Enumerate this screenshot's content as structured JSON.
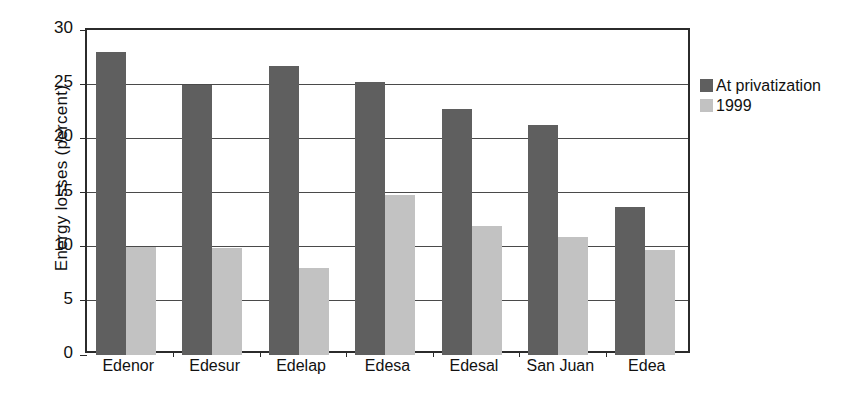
{
  "chart_data": {
    "type": "bar",
    "title": "",
    "xlabel": "",
    "ylabel": "Energy losses  (percent)",
    "ylim": [
      0,
      30
    ],
    "yticks": [
      0,
      5,
      10,
      15,
      20,
      25,
      30
    ],
    "ytick_labels": [
      "0",
      "5",
      "10",
      "15",
      "20",
      "25",
      "30"
    ],
    "grid": true,
    "legend_position": "right",
    "categories": [
      "Edenor",
      "Edesur",
      "Edelap",
      "Edesa",
      "Edesal",
      "San Juan",
      "Edea"
    ],
    "series": [
      {
        "name": "At privatization",
        "color": "#5f5f5f",
        "values": [
          28.0,
          24.9,
          26.7,
          25.2,
          22.7,
          21.2,
          13.7
        ]
      },
      {
        "name": "1999",
        "color": "#c2c2c2",
        "values": [
          10.0,
          9.9,
          8.0,
          14.8,
          11.9,
          10.9,
          9.7
        ]
      }
    ]
  },
  "legend": {
    "entries": [
      {
        "label": "At privatization",
        "swatch": "dark-gray-swatch"
      },
      {
        "label": "1999",
        "swatch": "light-gray-swatch"
      }
    ]
  },
  "colors": {
    "series_at_privatization": "#5f5f5f",
    "series_1999": "#c2c2c2",
    "axis": "#2b2b2b",
    "grid": "#4a4a4a",
    "background": "#ffffff"
  }
}
